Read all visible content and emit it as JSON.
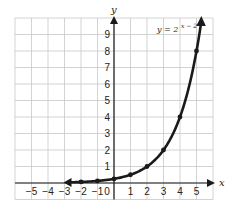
{
  "chart_data": {
    "type": "line",
    "title": "",
    "xlabel": "x",
    "ylabel": "y",
    "xlim": [
      -6,
      6
    ],
    "ylim": [
      -1,
      10
    ],
    "grid": true,
    "x_ticks": [
      -5,
      -4,
      -3,
      -2,
      -1,
      0,
      1,
      2,
      3,
      4,
      5
    ],
    "y_ticks": [
      1,
      2,
      3,
      4,
      5,
      6,
      7,
      8,
      9
    ],
    "series": [
      {
        "name": "y = 2^(x − 2)",
        "equation_label": "y = 2",
        "equation_exponent": "x − 2",
        "x": [
          -2,
          -1,
          0,
          1,
          2,
          3,
          4,
          5
        ],
        "values": [
          0.0625,
          0.125,
          0.25,
          0.5,
          1,
          2,
          4,
          8
        ],
        "color": "#1a1a1a",
        "markers": true,
        "arrow_left_end_x": -3,
        "arrow_right_end_y": 10
      }
    ]
  },
  "layout": {
    "origin_px": [
      114,
      183
    ],
    "unit_px": 16.5,
    "grid_color": "#c8c8c8",
    "axis_color": "#1a1a1a"
  }
}
